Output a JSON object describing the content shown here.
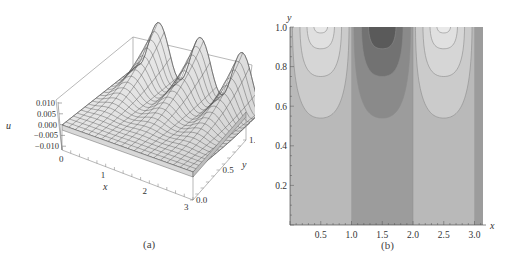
{
  "figure": {
    "panels": [
      {
        "caption": "(a)"
      },
      {
        "caption": "(b)"
      }
    ]
  },
  "chart_data": [
    {
      "type": "surface3d",
      "title": "",
      "xlabel": "x",
      "ylabel": "y",
      "zlabel": "u",
      "x_ticks": [
        "0",
        "1",
        "2",
        "3"
      ],
      "y_ticks": [
        "0.0",
        "0.5",
        "1.0"
      ],
      "z_ticks": [
        "0.010",
        "0.005",
        "0.000",
        "−0.005",
        "−0.010"
      ],
      "xlim": [
        0,
        3.14159
      ],
      "ylim": [
        0,
        1
      ],
      "zlim": [
        -0.01,
        0.01
      ],
      "description": "Surface u(x,y) flat near 0 at y=0, rising to two peaks near y=1 at x≈0.5 and x≈2.5 with a valley near x≈1.5",
      "mesh": "gray mesh, ~20x20 grid"
    },
    {
      "type": "contour",
      "title": "",
      "xlabel": "x",
      "ylabel": "y",
      "x_ticks": [
        "0.5",
        "1.0",
        "1.5",
        "2.0",
        "2.5",
        "3.0"
      ],
      "y_ticks": [
        "0.2",
        "0.4",
        "0.6",
        "0.8",
        "1.0"
      ],
      "xlim": [
        0,
        3.14159
      ],
      "ylim": [
        0,
        1
      ],
      "vertical_bands": [
        {
          "x_from": 0.0,
          "x_to": 1.0,
          "shade": "#b9b9b9"
        },
        {
          "x_from": 1.0,
          "x_to": 2.0,
          "shade": "#9c9c9c"
        },
        {
          "x_from": 2.0,
          "x_to": 3.0,
          "shade": "#b9b9b9"
        },
        {
          "x_from": 3.0,
          "x_to": 3.14159,
          "shade": "#9c9c9c"
        }
      ],
      "light_lobes": [
        {
          "center_x": 0.5,
          "levels_bottom_y": [
            0.54,
            0.75,
            0.89,
            0.97
          ]
        },
        {
          "center_x": 2.5,
          "levels_bottom_y": [
            0.54,
            0.75,
            0.89,
            0.97
          ]
        }
      ],
      "dark_lobes": [
        {
          "center_x": 1.5,
          "levels_bottom_y": [
            0.54,
            0.75,
            0.89
          ]
        }
      ],
      "colors": {
        "light_1": "#cbcbcb",
        "light_2": "#d6d6d6",
        "light_3": "#e0e0e0",
        "light_4": "#e9e9e9",
        "dark_1": "#8a8a8a",
        "dark_2": "#727272",
        "dark_3": "#5a5a5a",
        "contour_line": "#8c8c8c"
      }
    }
  ]
}
